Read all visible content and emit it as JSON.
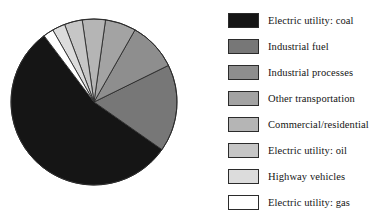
{
  "chart_data": {
    "type": "pie",
    "title": "",
    "subtitle": "",
    "xlabel": "",
    "ylabel": "",
    "grid": false,
    "legend_position": "right",
    "start_angle_deg": 0,
    "direction": "clockwise",
    "categories": [
      "Electric utility: coal",
      "Industrial fuel",
      "Industrial processes",
      "Other transportation",
      "Commercial/residential",
      "Electric utility: oil",
      "Highway vehicles",
      "Electric utility: gas"
    ],
    "values": [
      55,
      17,
      9.5,
      6,
      4.5,
      3.5,
      2.5,
      2
    ],
    "colors": [
      "#151515",
      "#777777",
      "#8e8e8e",
      "#a3a3a3",
      "#b5b5b5",
      "#c6c6c6",
      "#dcdcdc",
      "#ffffff"
    ],
    "slices": [
      {
        "label": "Electric utility: coal",
        "value": 55,
        "color": "#151515",
        "start_deg": 125.0,
        "end_deg": 323.0
      },
      {
        "label": "Industrial fuel",
        "value": 17,
        "color": "#777777",
        "start_deg": 63.8,
        "end_deg": 125.0
      },
      {
        "label": "Industrial processes",
        "value": 9.5,
        "color": "#8e8e8e",
        "start_deg": 29.6,
        "end_deg": 63.8
      },
      {
        "label": "Other transportation",
        "value": 6,
        "color": "#a3a3a3",
        "start_deg": 8.0,
        "end_deg": 29.6
      },
      {
        "label": "Commercial/residential",
        "value": 4.5,
        "color": "#b5b5b5",
        "start_deg": -8.2,
        "end_deg": 8.0
      },
      {
        "label": "Electric utility: oil",
        "value": 3.5,
        "color": "#c6c6c6",
        "start_deg": -20.8,
        "end_deg": -8.2
      },
      {
        "label": "Highway vehicles",
        "value": 2.5,
        "color": "#dcdcdc",
        "start_deg": -29.8,
        "end_deg": -20.8
      },
      {
        "label": "Electric utility: gas",
        "value": 2,
        "color": "#ffffff",
        "start_deg": -37.0,
        "end_deg": -29.8
      }
    ]
  },
  "legend": {
    "items": [
      {
        "label": "Electric utility: coal",
        "color": "#151515"
      },
      {
        "label": "Industrial fuel",
        "color": "#777777"
      },
      {
        "label": "Industrial processes",
        "color": "#8e8e8e"
      },
      {
        "label": "Other transportation",
        "color": "#a3a3a3"
      },
      {
        "label": "Commercial/residential",
        "color": "#b5b5b5"
      },
      {
        "label": "Electric utility: oil",
        "color": "#c6c6c6"
      },
      {
        "label": "Highway vehicles",
        "color": "#dcdcdc"
      },
      {
        "label": "Electric utility: gas",
        "color": "#ffffff"
      }
    ]
  },
  "pie": {
    "center_x": 94,
    "center_y": 102,
    "radius": 83,
    "outline_color": "#2b2b2b"
  }
}
